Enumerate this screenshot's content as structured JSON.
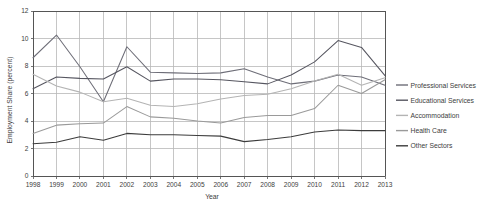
{
  "chart_data": {
    "type": "line",
    "title": "",
    "xlabel": "Year",
    "ylabel": "Employment Share (percent)",
    "x": [
      1998,
      1999,
      2000,
      2001,
      2002,
      2003,
      2004,
      2005,
      2006,
      2007,
      2008,
      2009,
      2010,
      2011,
      2012,
      2013
    ],
    "xtick_labels": [
      "1998",
      "1999",
      "2000",
      "2001",
      "2002",
      "2003",
      "2004",
      "2005",
      "2006",
      "2007",
      "2008",
      "2009",
      "2010",
      "2011",
      "2012",
      "2013"
    ],
    "ytick_labels": [
      "0",
      "2",
      "4",
      "6",
      "8",
      "10",
      "12"
    ],
    "yticks": [
      0,
      2,
      4,
      6,
      8,
      10,
      12
    ],
    "ylim": [
      0,
      12
    ],
    "xlim": [
      1998,
      2013
    ],
    "grid": true,
    "legend_position": "right",
    "series": [
      {
        "name": "Professional Services",
        "color": "#6e6e78",
        "values": [
          8.6,
          10.25,
          7.95,
          5.4,
          9.4,
          7.55,
          7.5,
          7.45,
          7.5,
          7.8,
          7.2,
          6.7,
          6.9,
          7.35,
          7.2,
          6.6
        ]
      },
      {
        "name": "Educational Services",
        "color": "#565660",
        "values": [
          6.35,
          7.2,
          7.1,
          7.05,
          7.95,
          6.9,
          7.05,
          7.05,
          7.0,
          6.85,
          6.7,
          7.35,
          8.3,
          9.85,
          9.35,
          7.3
        ]
      },
      {
        "name": "Accommodation",
        "color": "#b4b4b4",
        "values": [
          7.4,
          6.55,
          6.1,
          5.4,
          5.65,
          5.15,
          5.05,
          5.25,
          5.6,
          5.85,
          5.95,
          6.35,
          6.9,
          7.4,
          6.6,
          7.15
        ]
      },
      {
        "name": "Health Care",
        "color": "#9a9a9a",
        "values": [
          3.1,
          3.7,
          3.8,
          3.85,
          5.05,
          4.3,
          4.2,
          4.0,
          3.85,
          4.25,
          4.4,
          4.4,
          4.9,
          6.6,
          6.0,
          7.0
        ]
      },
      {
        "name": "Other Sectors",
        "color": "#3c3c3c",
        "values": [
          2.35,
          2.45,
          2.85,
          2.6,
          3.1,
          3.0,
          3.0,
          2.95,
          2.9,
          2.5,
          2.65,
          2.85,
          3.2,
          3.35,
          3.3,
          3.3
        ]
      }
    ]
  },
  "axis": {
    "y_title": "Employment Share (percent)",
    "x_title": "Year"
  },
  "legend": {
    "items": [
      {
        "label": "Professional Services"
      },
      {
        "label": "Educational Services"
      },
      {
        "label": "Accommodation"
      },
      {
        "label": "Health Care"
      },
      {
        "label": "Other Sectors"
      }
    ]
  }
}
